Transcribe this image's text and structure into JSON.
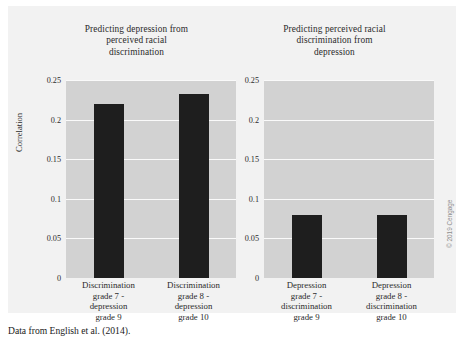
{
  "caption": "Data from English et al. (2014).",
  "copyright": "© 2019 Cengage",
  "axis": {
    "ylabel": "Correlation",
    "yticks": [
      "0.25",
      "0.2",
      "0.15",
      "0.1",
      "0.05",
      "0"
    ]
  },
  "chart_data": [
    {
      "type": "bar",
      "title": "Predicting depression from perceived racial discrimination",
      "title_lines": [
        "Predicting depression from",
        "perceived racial",
        "discrimination"
      ],
      "categories": [
        "Discrimination grade 7 - depression grade 9",
        "Discrimination grade 8 - depression grade 10"
      ],
      "category_lines": [
        [
          "Discrimination",
          "grade 7 -",
          "depression",
          "grade 9"
        ],
        [
          "Discrimination",
          "grade 8 -",
          "depression",
          "grade 10"
        ]
      ],
      "values": [
        0.22,
        0.232
      ],
      "xlabel": "",
      "ylabel": "Correlation",
      "ylim": [
        0,
        0.25
      ],
      "yticks": [
        0,
        0.05,
        0.1,
        0.15,
        0.2,
        0.25
      ],
      "grid": true,
      "legend": "none",
      "bar_color": "#1e1e1e",
      "plot_background": "#d2d2d2"
    },
    {
      "type": "bar",
      "title": "Predicting perceived racial discrimination from depression",
      "title_lines": [
        "Predicting perceived racial",
        "discrimination from",
        "depression"
      ],
      "categories": [
        "Depression grade 7 - discrimination grade 9",
        "Depression grade 8 - discrimination grade 10"
      ],
      "category_lines": [
        [
          "Depression",
          "grade 7 -",
          "discrimination",
          "grade 9"
        ],
        [
          "Depression",
          "grade 8 -",
          "discrimination",
          "grade 10"
        ]
      ],
      "values": [
        0.08,
        0.08
      ],
      "xlabel": "",
      "ylabel": "",
      "ylim": [
        0,
        0.25
      ],
      "yticks": [
        0,
        0.05,
        0.1,
        0.15,
        0.2,
        0.25
      ],
      "grid": true,
      "legend": "none",
      "bar_color": "#1e1e1e",
      "plot_background": "#d2d2d2"
    }
  ]
}
